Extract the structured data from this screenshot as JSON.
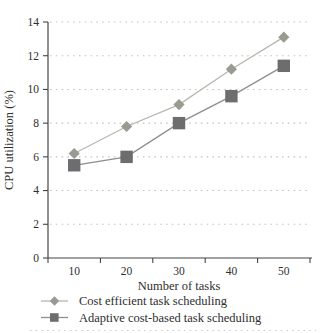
{
  "chart_data": {
    "type": "line",
    "title": "",
    "xlabel": "Number of tasks",
    "ylabel": "CPU utilization (%)",
    "categories": [
      "10",
      "20",
      "30",
      "40",
      "50"
    ],
    "ylim": [
      0,
      14
    ],
    "yticks": [
      0,
      2,
      4,
      6,
      8,
      10,
      12,
      14
    ],
    "grid": "dotted-horizontal",
    "legend_position": "bottom-left",
    "series": [
      {
        "name": "Cost efficient task scheduling",
        "marker": "diamond",
        "values": [
          6.2,
          7.8,
          9.1,
          11.2,
          13.1
        ],
        "line_color": "#b7b7af",
        "marker_color": "#9a9a92"
      },
      {
        "name": "Adaptive cost-based task scheduling",
        "marker": "square",
        "values": [
          5.5,
          6.0,
          8.0,
          9.6,
          11.4
        ],
        "line_color": "#8e8e8e",
        "marker_color": "#6d6d6f"
      }
    ]
  },
  "colors": {
    "axis": "#454545",
    "gridline": "#c4c4c4",
    "text": "#2e2e2e",
    "bottom_rule": "#cbcbcb",
    "background": "#ffffff"
  }
}
